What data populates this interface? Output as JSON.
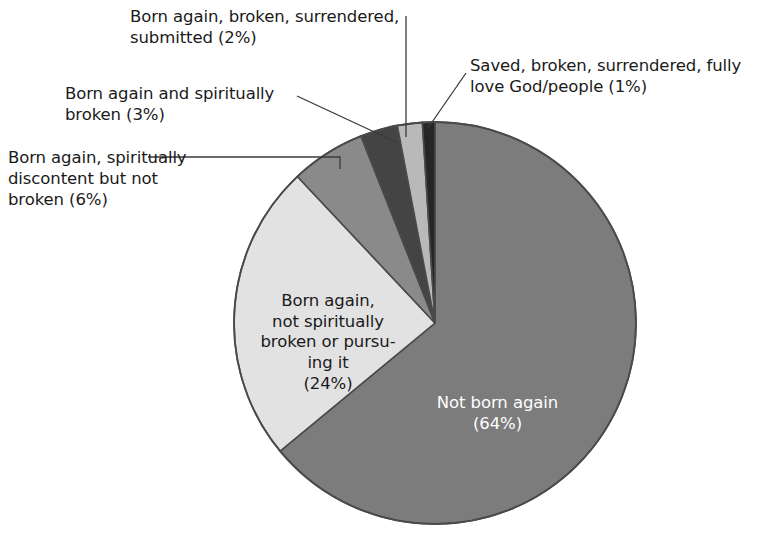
{
  "chart_data": {
    "type": "pie",
    "title": "",
    "subtitle": "",
    "xlabel": "",
    "ylabel": "",
    "legend_position": "none",
    "grid": false,
    "total_percent": 100,
    "start_angle_deg": 0,
    "direction": "clockwise",
    "categories": [
      "Not born again",
      "Born again, not spiritually broken or pursuing it",
      "Born again, spiritually discontent but not broken",
      "Born again and spiritually broken",
      "Born again, broken, surrendered, submitted",
      "Saved, broken, surrendered, fully love God/people"
    ],
    "values": [
      64,
      24,
      6,
      3,
      2,
      1
    ],
    "slices": [
      {
        "id": "not-born-again",
        "label": "Not born again",
        "percent": 64,
        "percent_text": "(64%)",
        "color": "#7c7c7c",
        "label_placement": "inside",
        "label_text_color": "#ffffff"
      },
      {
        "id": "born-again-not-broken",
        "label": "Born again,\nnot spiritually\nbroken or pursu-\ning it",
        "percent": 24,
        "percent_text": "(24%)",
        "color": "#e2e2e2",
        "label_placement": "inside",
        "label_text_color": "#1a1a1a"
      },
      {
        "id": "spiritually-discontent",
        "label": "Born again, spiritually\ndiscontent but not\nbroken (6%)",
        "percent": 6,
        "percent_text": "(6%)",
        "color": "#8a8a8a",
        "label_placement": "callout-left",
        "label_text_color": "#1a1a1a"
      },
      {
        "id": "born-again-spiritually-broken",
        "label": "Born again and spiritually\nbroken (3%)",
        "percent": 3,
        "percent_text": "(3%)",
        "color": "#444444",
        "label_placement": "callout-left",
        "label_text_color": "#1a1a1a"
      },
      {
        "id": "broken-surrendered-submitted",
        "label": "Born again, broken, surrendered,\nsubmitted (2%)",
        "percent": 2,
        "percent_text": "(2%)",
        "color": "#b9b9b9",
        "label_placement": "callout-top",
        "label_text_color": "#1a1a1a"
      },
      {
        "id": "saved-fully-love",
        "label": "Saved, broken, surrendered, fully\nlove God/people (1%)",
        "percent": 1,
        "percent_text": "(1%)",
        "color": "#262626",
        "label_placement": "callout-right",
        "label_text_color": "#1a1a1a"
      }
    ],
    "geometry": {
      "center_x": 435,
      "center_y": 323,
      "radius": 201,
      "outline_color": "#4a4a4a",
      "leader_line_color": "#3a3a3a"
    }
  },
  "canvas": {
    "background": "#ffffff",
    "width": 769,
    "height": 539
  }
}
